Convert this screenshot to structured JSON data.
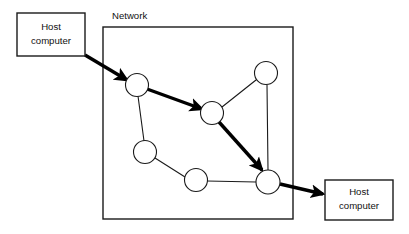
{
  "figure": {
    "kind": "network-diagram",
    "background_color": "#ffffff",
    "line_color": "#1a1a1a",
    "thick_path_color": "#000000",
    "width": 409,
    "height": 234
  },
  "network": {
    "label": "Network",
    "label_x": 112,
    "label_y": 16,
    "rect": {
      "x": 103,
      "y": 27,
      "width": 190,
      "height": 192
    }
  },
  "hosts": [
    {
      "id": "host-left",
      "line1": "Host",
      "line2": "computer",
      "rect": {
        "x": 17,
        "y": 13,
        "width": 68,
        "height": 43
      },
      "text_x": 51,
      "text_line1_y": 27,
      "text_line2_y": 41
    },
    {
      "id": "host-right",
      "line1": "Host",
      "line2": "computer",
      "rect": {
        "x": 325,
        "y": 180,
        "width": 68,
        "height": 40
      },
      "text_x": 359,
      "text_line1_y": 192,
      "text_line2_y": 206
    }
  ],
  "nodes": [
    {
      "id": "n1",
      "cx": 137,
      "cy": 85,
      "r": 11.5
    },
    {
      "id": "n2",
      "cx": 212,
      "cy": 113,
      "r": 11.5
    },
    {
      "id": "n3",
      "cx": 266,
      "cy": 73,
      "r": 11.5
    },
    {
      "id": "n4",
      "cx": 145,
      "cy": 152,
      "r": 11.5
    },
    {
      "id": "n5",
      "cx": 196,
      "cy": 180,
      "r": 11.5
    },
    {
      "id": "n6",
      "cx": 268,
      "cy": 182,
      "r": 12.0
    }
  ],
  "thin_edges": [
    {
      "id": "e-n1-n4",
      "from": "n1",
      "to": "n4",
      "x1": 138,
      "y1": 96,
      "x2": 144,
      "y2": 141
    },
    {
      "id": "e-n2-n3",
      "from": "n2",
      "to": "n3",
      "x1": 222,
      "y1": 107,
      "x2": 256,
      "y2": 80
    },
    {
      "id": "e-n3-n6",
      "from": "n3",
      "to": "n6",
      "x1": 267,
      "y1": 85,
      "x2": 268,
      "y2": 170
    },
    {
      "id": "e-n4-n5",
      "from": "n4",
      "to": "n5",
      "x1": 155,
      "y1": 158,
      "x2": 185,
      "y2": 177
    },
    {
      "id": "e-n5-n6",
      "from": "n5",
      "to": "n6",
      "x1": 207,
      "y1": 181,
      "x2": 256,
      "y2": 182
    }
  ],
  "thick_path": {
    "description": "Routed message path from left host through the network to the right host",
    "segments": [
      {
        "id": "seg-host-n1",
        "from": "host-left",
        "to": "n1",
        "x1": 85,
        "y1": 55,
        "x2": 127,
        "y2": 80
      },
      {
        "id": "seg-n1-n2",
        "from": "n1",
        "to": "n2",
        "x1": 147,
        "y1": 89,
        "x2": 202,
        "y2": 109
      },
      {
        "id": "seg-n2-n6",
        "from": "n2",
        "to": "n6",
        "x1": 219,
        "y1": 122,
        "x2": 262,
        "y2": 170
      },
      {
        "id": "seg-n6-host",
        "from": "n6",
        "to": "host-right",
        "x1": 280,
        "y1": 184,
        "x2": 323,
        "y2": 194
      }
    ]
  }
}
